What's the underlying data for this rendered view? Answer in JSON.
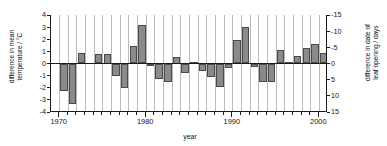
{
  "chart_data": {
    "type": "bar",
    "title": "",
    "subtitle": "",
    "xlabel": "year",
    "ylabel": "difference in mean\ntemperature / °C",
    "ylabel_secondary": "difference in date of\nleaf opening / days",
    "xlim": [
      1969,
      2001
    ],
    "ylim": [
      -4,
      4
    ],
    "ylim_secondary": [
      15,
      -15
    ],
    "yticks": [
      4,
      3,
      2,
      1,
      0,
      -1,
      -2,
      -3,
      -4
    ],
    "ytick_labels": [
      "4",
      "3",
      "2",
      "1",
      "0",
      "-1",
      "-2",
      "-3",
      "-4"
    ],
    "yticks_secondary": [
      -15,
      -10,
      -5,
      0,
      5,
      10,
      15
    ],
    "ytick_labels_secondary": [
      "-15",
      "-10",
      "-5",
      "0",
      "5",
      "10",
      "15"
    ],
    "xticks": [
      1970,
      1980,
      1990,
      2000
    ],
    "xtick_labels": [
      "1970",
      "1980",
      "1990",
      "2000"
    ],
    "grid": "vertical",
    "legend": "none",
    "bar_color": "#8a8a8a",
    "bar_edge_color": "#4a4a4a",
    "axis_color": "#1a1a1a",
    "gridline_color": "#b9b9b9",
    "categories": [
      1970,
      1971,
      1972,
      1973,
      1974,
      1975,
      1976,
      1977,
      1978,
      1979,
      1980,
      1981,
      1982,
      1983,
      1984,
      1985,
      1986,
      1987,
      1988,
      1989,
      1990,
      1991,
      1992,
      1993,
      1994,
      1995,
      1996,
      1997,
      1998,
      1999,
      2000
    ],
    "values": [
      -2.3,
      -3.3,
      0.9,
      0.0,
      0.8,
      0.75,
      -1.0,
      -2.0,
      1.45,
      3.2,
      -0.1,
      -1.25,
      -1.5,
      0.5,
      -0.75,
      0.15,
      -0.6,
      -1.1,
      -1.9,
      -0.4,
      1.9,
      3.05,
      -0.3,
      -1.5,
      -1.55,
      1.15,
      0.1,
      0.6,
      1.3,
      1.6,
      0.9
    ],
    "series": [
      {
        "name": "difference in mean temperature",
        "unit": "°C",
        "values": [
          -2.3,
          -3.3,
          0.9,
          0.0,
          0.8,
          0.75,
          -1.0,
          -2.0,
          1.45,
          3.2,
          -0.1,
          -1.25,
          -1.5,
          0.5,
          -0.75,
          0.15,
          -0.6,
          -1.1,
          -1.9,
          -0.4,
          1.9,
          3.05,
          -0.3,
          -1.5,
          -1.55,
          1.15,
          0.1,
          0.6,
          1.3,
          1.6,
          0.9
        ]
      }
    ]
  }
}
